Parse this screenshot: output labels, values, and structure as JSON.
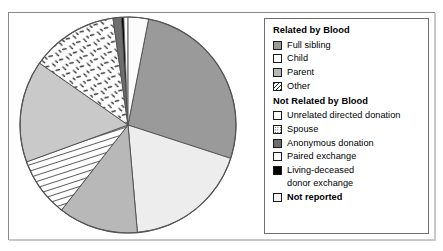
{
  "chart_data": {
    "type": "pie",
    "title": "",
    "legend_position": "right",
    "grid": false,
    "categories": [
      "Full sibling",
      "Child",
      "Parent",
      "Spouse",
      "Unrelated directed donation",
      "Other",
      "Anonymous donation",
      "Living-deceased donor exchange",
      "Paired exchange",
      "Not reported"
    ],
    "values": [
      27,
      19,
      12,
      9,
      15,
      13,
      1.5,
      0.5,
      1,
      2
    ],
    "slice_order_clockwise_from_12": [
      {
        "label": "Full sibling",
        "start_deg": 11,
        "end_deg": 108,
        "fill": "#9a9a9a",
        "pattern": "solid"
      },
      {
        "label": "Child",
        "start_deg": 108,
        "end_deg": 175,
        "fill": "#ededed",
        "pattern": "solid"
      },
      {
        "label": "Parent",
        "start_deg": 175,
        "end_deg": 218,
        "fill": "#b8b8b8",
        "pattern": "solid"
      },
      {
        "label": "Spouse",
        "start_deg": 218,
        "end_deg": 250,
        "fill": "#ffffff",
        "pattern": "hatch"
      },
      {
        "label": "Unrelated directed donation",
        "start_deg": 250,
        "end_deg": 305,
        "fill": "#c9c9c9",
        "pattern": "solid"
      },
      {
        "label": "Other",
        "start_deg": 305,
        "end_deg": 352,
        "fill": "#ffffff",
        "pattern": "dash"
      },
      {
        "label": "Anonymous donation",
        "start_deg": 352,
        "end_deg": 356.5,
        "fill": "#6e6e6e",
        "pattern": "solid"
      },
      {
        "label": "Living-deceased donor exchange",
        "start_deg": 356.5,
        "end_deg": 357.8,
        "fill": "#000000",
        "pattern": "solid"
      },
      {
        "label": "Paired exchange",
        "start_deg": 357.8,
        "end_deg": 360,
        "fill": "#ffffff",
        "pattern": "solid"
      },
      {
        "label": "Not reported",
        "start_deg": 0,
        "end_deg": 11,
        "fill": "#fcfcfc",
        "pattern": "solid"
      }
    ],
    "geometry": {
      "cx": 118,
      "cy": 112,
      "r": 108
    }
  },
  "legend": {
    "group_related": {
      "heading": "Related by Blood",
      "items": [
        {
          "label": "Full sibling",
          "swatch": "solid-medium-gray",
          "color": "#9a9a9a"
        },
        {
          "label": "Child",
          "swatch": "solid-white",
          "color": "#ffffff"
        },
        {
          "label": "Parent",
          "swatch": "solid-light-gray",
          "color": "#b8b8b8"
        },
        {
          "label": "Other",
          "swatch": "diagonal-hatch",
          "color": "#ffffff"
        }
      ]
    },
    "group_not_related": {
      "heading": "Not Related by Blood",
      "items": [
        {
          "label": "Unrelated directed donation",
          "swatch": "solid-white",
          "color": "#ffffff"
        },
        {
          "label": "Spouse",
          "swatch": "stipple-dots",
          "color": "#ffffff"
        },
        {
          "label": "Anonymous donation",
          "swatch": "solid-dark-gray",
          "color": "#6e6e6e"
        },
        {
          "label": "Paired exchange",
          "swatch": "solid-white",
          "color": "#ffffff"
        },
        {
          "label": "Living-deceased",
          "label_line2": "donor exchange",
          "swatch": "solid-black",
          "color": "#000000"
        }
      ]
    },
    "not_reported": {
      "label": "Not reported",
      "swatch": "solid-offwhite",
      "color": "#f2f2f2",
      "bold": true
    }
  }
}
